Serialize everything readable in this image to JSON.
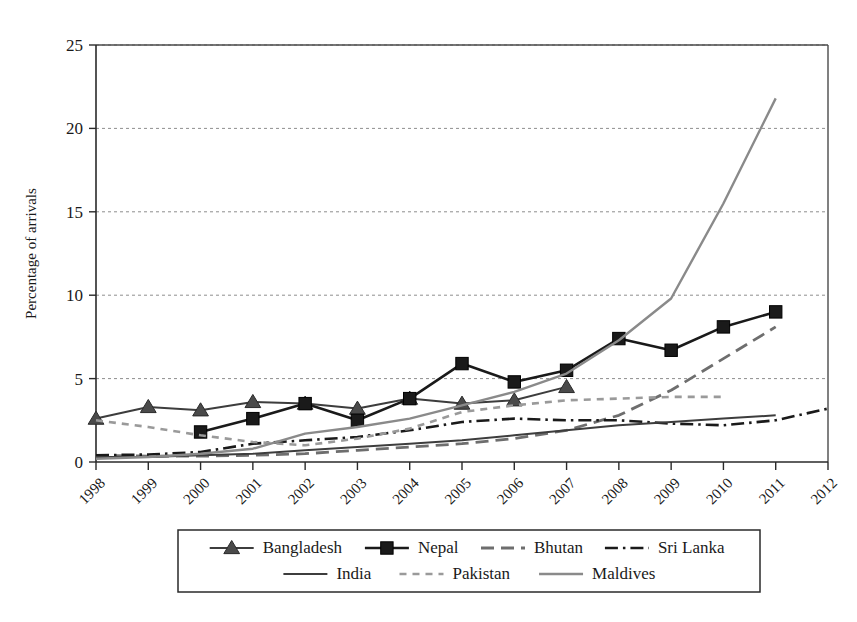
{
  "chart_data": {
    "type": "line",
    "title": "",
    "xlabel": "",
    "ylabel": "Percentage of arrivals",
    "xlim": [
      1998,
      2012
    ],
    "ylim": [
      0,
      25
    ],
    "yticks": [
      0,
      5,
      10,
      15,
      20,
      25
    ],
    "ytick_labels": [
      "0",
      "5",
      "10",
      "15",
      "20",
      "25"
    ],
    "x": [
      1998,
      1999,
      2000,
      2001,
      2002,
      2003,
      2004,
      2005,
      2006,
      2007,
      2008,
      2009,
      2010,
      2011,
      2012
    ],
    "xtick_labels": [
      "1998",
      "1999",
      "2000",
      "2001",
      "2002",
      "2003",
      "2004",
      "2005",
      "2006",
      "2007",
      "2008",
      "2009",
      "2010",
      "2011",
      "2012"
    ],
    "grid": "horizontal-dotted",
    "legend_position": "bottom-outside",
    "series": [
      {
        "name": "Bangladesh",
        "marker": "triangle",
        "line_style": "solid",
        "color": "#3d3d3d",
        "x": [
          1998,
          1999,
          2000,
          2001,
          2002,
          2003,
          2004,
          2005,
          2006,
          2007
        ],
        "values": [
          2.6,
          3.3,
          3.1,
          3.6,
          3.5,
          3.2,
          3.8,
          3.5,
          3.7,
          4.5
        ]
      },
      {
        "name": "Nepal",
        "marker": "square",
        "line_style": "solid",
        "color": "#1a1a1a",
        "x": [
          2000,
          2001,
          2002,
          2003,
          2004,
          2005,
          2006,
          2007,
          2008,
          2009,
          2010,
          2011
        ],
        "values": [
          1.8,
          2.6,
          3.5,
          2.5,
          3.8,
          5.9,
          4.8,
          5.5,
          7.4,
          6.7,
          8.1,
          9.0
        ]
      },
      {
        "name": "Bhutan",
        "marker": "none",
        "line_style": "long-dash",
        "color": "#6e6e6e",
        "x": [
          1998,
          1999,
          2000,
          2001,
          2002,
          2003,
          2004,
          2005,
          2006,
          2007,
          2008,
          2009,
          2010,
          2011
        ],
        "values": [
          0.4,
          0.35,
          0.35,
          0.4,
          0.5,
          0.7,
          0.9,
          1.1,
          1.4,
          1.9,
          2.8,
          4.3,
          6.2,
          8.1
        ]
      },
      {
        "name": "Sri Lanka",
        "marker": "none",
        "line_style": "dash-dot",
        "color": "#1a1a1a",
        "x": [
          1998,
          1999,
          2000,
          2001,
          2002,
          2003,
          2004,
          2005,
          2006,
          2007,
          2008,
          2009,
          2010,
          2011,
          2012
        ],
        "values": [
          0.4,
          0.45,
          0.6,
          1.1,
          1.3,
          1.5,
          1.9,
          2.4,
          2.6,
          2.5,
          2.5,
          2.3,
          2.2,
          2.5,
          3.2
        ]
      },
      {
        "name": "India",
        "marker": "none",
        "line_style": "solid",
        "color": "#3d3d3d",
        "x": [
          1998,
          1999,
          2000,
          2001,
          2002,
          2003,
          2004,
          2005,
          2006,
          2007,
          2008,
          2009,
          2010,
          2011
        ],
        "values": [
          0.3,
          0.3,
          0.4,
          0.5,
          0.7,
          0.9,
          1.1,
          1.3,
          1.6,
          1.9,
          2.2,
          2.4,
          2.6,
          2.8
        ]
      },
      {
        "name": "Pakistan",
        "marker": "none",
        "line_style": "short-dash",
        "color": "#9a9a9a",
        "x": [
          1998,
          1999,
          2000,
          2001,
          2002,
          2003,
          2004,
          2005,
          2006,
          2007,
          2008,
          2009,
          2010
        ],
        "values": [
          2.5,
          2.1,
          1.6,
          1.2,
          1.0,
          1.4,
          2.0,
          3.0,
          3.4,
          3.7,
          3.8,
          3.9,
          3.9
        ]
      },
      {
        "name": "Maldives",
        "marker": "none",
        "line_style": "solid",
        "color": "#8a8a8a",
        "x": [
          1998,
          1999,
          2000,
          2001,
          2002,
          2003,
          2004,
          2005,
          2006,
          2007,
          2008,
          2009,
          2010,
          2011
        ],
        "values": [
          0.2,
          0.3,
          0.5,
          0.8,
          1.7,
          2.1,
          2.6,
          3.4,
          4.2,
          5.3,
          7.3,
          9.8,
          15.5,
          21.8
        ]
      }
    ]
  },
  "legend": {
    "row1": [
      "Bangladesh",
      "Nepal",
      "Bhutan",
      "Sri Lanka"
    ],
    "row2": [
      "India",
      "Pakistan",
      "Maldives"
    ]
  }
}
